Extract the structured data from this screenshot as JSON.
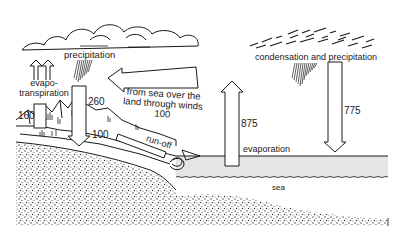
{
  "diagram": {
    "type": "water-cycle",
    "labels": {
      "precipitation": "precipitation",
      "evapotranspiration_line1": "evapo-",
      "evapotranspiration_line2": "transpiration",
      "wind_transport_line1": "from sea over the",
      "wind_transport_line2": "land through winds",
      "wind_transport_value": "100",
      "condensation": "condensation and precipitation",
      "evaporation": "evaporation",
      "runoff": "run-off",
      "sea": "sea"
    },
    "values": {
      "evapotranspiration": "160",
      "land_precipitation": "260",
      "runoff": "100",
      "sea_evaporation": "875",
      "sea_precipitation": "775"
    },
    "colors": {
      "ink": "#1a1a1a",
      "sea_fill": "#e6e6e6",
      "background": "#ffffff"
    }
  }
}
